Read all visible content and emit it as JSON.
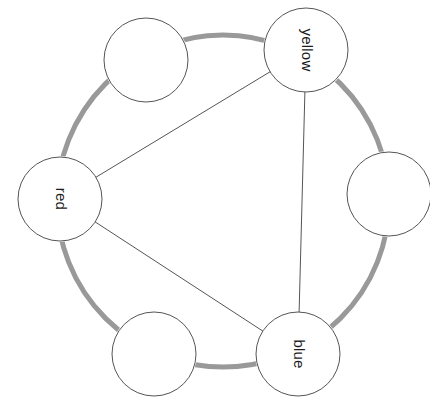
{
  "diagram": {
    "background_color": "#ffffff",
    "ring": {
      "name": "outer-ring",
      "color": "#999999",
      "stroke_width": 5,
      "center_x": 223,
      "center_y": 201,
      "radius": 166
    },
    "node_style": {
      "fill": "#ffffff",
      "stroke_color": "#555555",
      "stroke_width": 1,
      "radius": 42
    },
    "edge_style": {
      "color": "#555555",
      "stroke_width": 1
    },
    "nodes": [
      {
        "id": "yellow",
        "label": "yellow",
        "cx": 306,
        "cy": 50,
        "r": 42,
        "rotation": 90,
        "labeled": true
      },
      {
        "id": "right-empty",
        "label": "",
        "cx": 389,
        "cy": 194,
        "r": 42,
        "rotation": 90,
        "labeled": false
      },
      {
        "id": "blue",
        "label": "blue",
        "cx": 298,
        "cy": 354,
        "r": 42,
        "rotation": 90,
        "labeled": true
      },
      {
        "id": "bottom-left-empty",
        "label": "",
        "cx": 154,
        "cy": 354,
        "r": 42,
        "rotation": 90,
        "labeled": false
      },
      {
        "id": "red",
        "label": "red",
        "cx": 60,
        "cy": 199,
        "r": 42,
        "rotation": 90,
        "labeled": true
      },
      {
        "id": "top-left-empty",
        "label": "",
        "cx": 146,
        "cy": 60,
        "r": 42,
        "rotation": 90,
        "labeled": false
      }
    ],
    "edges": [
      {
        "from": "yellow",
        "to": "red",
        "name": "edge-yellow-red"
      },
      {
        "from": "yellow",
        "to": "blue",
        "name": "edge-yellow-blue"
      },
      {
        "from": "red",
        "to": "blue",
        "name": "edge-red-blue"
      }
    ],
    "labels": {
      "yellow": "yellow",
      "red": "red",
      "blue": "blue"
    }
  }
}
